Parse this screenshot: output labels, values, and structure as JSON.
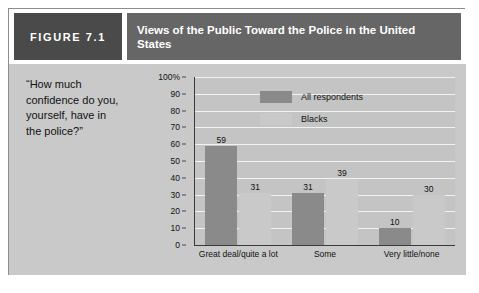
{
  "figure": {
    "label": "FIGURE 7.1",
    "title": "Views of the Public Toward the Police in the United States",
    "quote": "“How much confidence do you, yourself, have in the police?”"
  },
  "colors": {
    "label_box": "#4a4a4a",
    "title_box": "#666666",
    "frame_background": "#c9c9c9",
    "plot_background": "#c4c4c4",
    "gridline": "#f2f2f2",
    "series_all_respondents": "#8a8a8a",
    "series_blacks": "#c9c9c9",
    "axis": "#3a3a3a"
  },
  "chart_data": {
    "type": "bar",
    "title": "Views of the Public Toward the Police in the United States",
    "xlabel": "",
    "ylabel": "",
    "ylim": [
      0,
      100
    ],
    "yticks": [
      "0",
      "10",
      "20",
      "30",
      "40",
      "50",
      "60",
      "70",
      "80",
      "90",
      "100%"
    ],
    "ytick_values": [
      0,
      10,
      20,
      30,
      40,
      50,
      60,
      70,
      80,
      90,
      100
    ],
    "grid": true,
    "legend_position": "inside-top-center",
    "categories": [
      "Great deal/quite a lot",
      "Some",
      "Very little/none"
    ],
    "series": [
      {
        "name": "All respondents",
        "values": [
          59,
          31,
          10
        ]
      },
      {
        "name": "Blacks",
        "values": [
          31,
          39,
          30
        ]
      }
    ]
  }
}
